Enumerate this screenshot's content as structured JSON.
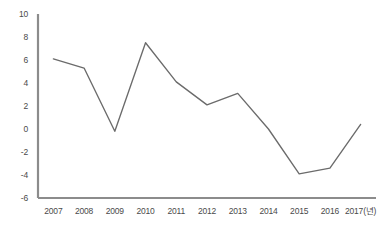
{
  "chart_data": {
    "type": "line",
    "title": "",
    "subtitle": "",
    "xlabel": "",
    "ylabel": "",
    "categories": [
      "2007",
      "2008",
      "2009",
      "2010",
      "2011",
      "2012",
      "2013",
      "2014",
      "2015",
      "2016",
      "2017"
    ],
    "x_tick_labels": [
      "2007",
      "2008",
      "2009",
      "2010",
      "2011",
      "2012",
      "2013",
      "2014",
      "2015",
      "2016",
      "2017(년)"
    ],
    "y_tick_labels": [
      "10",
      "8",
      "6",
      "4",
      "2",
      "0",
      "-2",
      "-4",
      "-6"
    ],
    "y_ticks": [
      10,
      8,
      6,
      4,
      2,
      0,
      -2,
      -4,
      -6
    ],
    "ylim": [
      -6,
      10
    ],
    "grid": false,
    "legend": false,
    "legend_position": "none",
    "series": [
      {
        "name": "",
        "values": [
          6.1,
          5.3,
          -0.2,
          7.5,
          4.1,
          2.1,
          3.1,
          0.0,
          -3.9,
          -3.4,
          0.4
        ]
      }
    ],
    "colors": {
      "line": "#6b6b6b",
      "axis": "#8c8c8c",
      "tick_label": "#4a4a4a",
      "background": "#ffffff"
    }
  }
}
